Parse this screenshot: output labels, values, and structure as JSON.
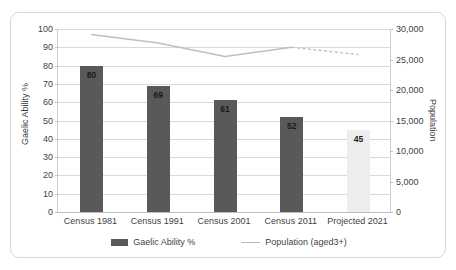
{
  "chart_data": {
    "type": "bar",
    "title": "",
    "subtitle": "",
    "categories": [
      "Census 1981",
      "Census 1991",
      "Census 2001",
      "Census 2011",
      "Projected 2021"
    ],
    "xlabel": "",
    "series": [
      {
        "name": "Gaelic Ability %",
        "type": "bar",
        "axis": "left",
        "values": [
          80,
          69,
          61,
          52,
          45
        ],
        "data_labels": [
          "80",
          "69",
          "61",
          "52",
          "45"
        ],
        "colors": [
          "#595959",
          "#595959",
          "#595959",
          "#595959",
          "#ededed"
        ]
      },
      {
        "name": "Population (aged3+)",
        "type": "line",
        "axis": "right",
        "values": [
          29100,
          27700,
          25500,
          27000,
          25800
        ],
        "color": "#bfbfbf",
        "dashed_from_index": 3
      }
    ],
    "left_axis": {
      "label": "Gaelic Ability %",
      "min": 0,
      "max": 100,
      "step": 10,
      "ticks": [
        "0",
        "10",
        "20",
        "30",
        "40",
        "50",
        "60",
        "70",
        "80",
        "90",
        "100"
      ]
    },
    "right_axis": {
      "label": "Population",
      "min": 0,
      "max": 30000,
      "step": 5000,
      "ticks": [
        "0",
        "5,000",
        "10,000",
        "15,000",
        "20,000",
        "25,000",
        "30,000"
      ]
    },
    "grid": true,
    "legend": {
      "position": "bottom",
      "entries": [
        {
          "label": "Gaelic Ability %",
          "marker": "bar-swatch-icon",
          "color": "#595959"
        },
        {
          "label": "Population (aged3+)",
          "marker": "line-swatch-icon",
          "color": "#bfbfbf"
        }
      ]
    },
    "colors": {
      "bar_primary": "#595959",
      "bar_projected": "#ededed",
      "line": "#bfbfbf",
      "gridline": "#d9d9d9",
      "frame_border": "#d8d8d8",
      "text": "#3f3f3f"
    }
  }
}
